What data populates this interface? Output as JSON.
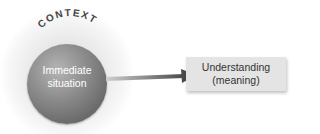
{
  "diagram": {
    "context_label": "CONTEXT",
    "sphere": {
      "line1": "Immediate",
      "line2": "situation"
    },
    "box": {
      "line1": "Understanding",
      "line2": "(meaning)"
    },
    "colors": {
      "sphere": "#8c8c8c",
      "box": "#e4e4e4",
      "arrow": "#5a5a5a",
      "context_text": "#444444"
    }
  }
}
